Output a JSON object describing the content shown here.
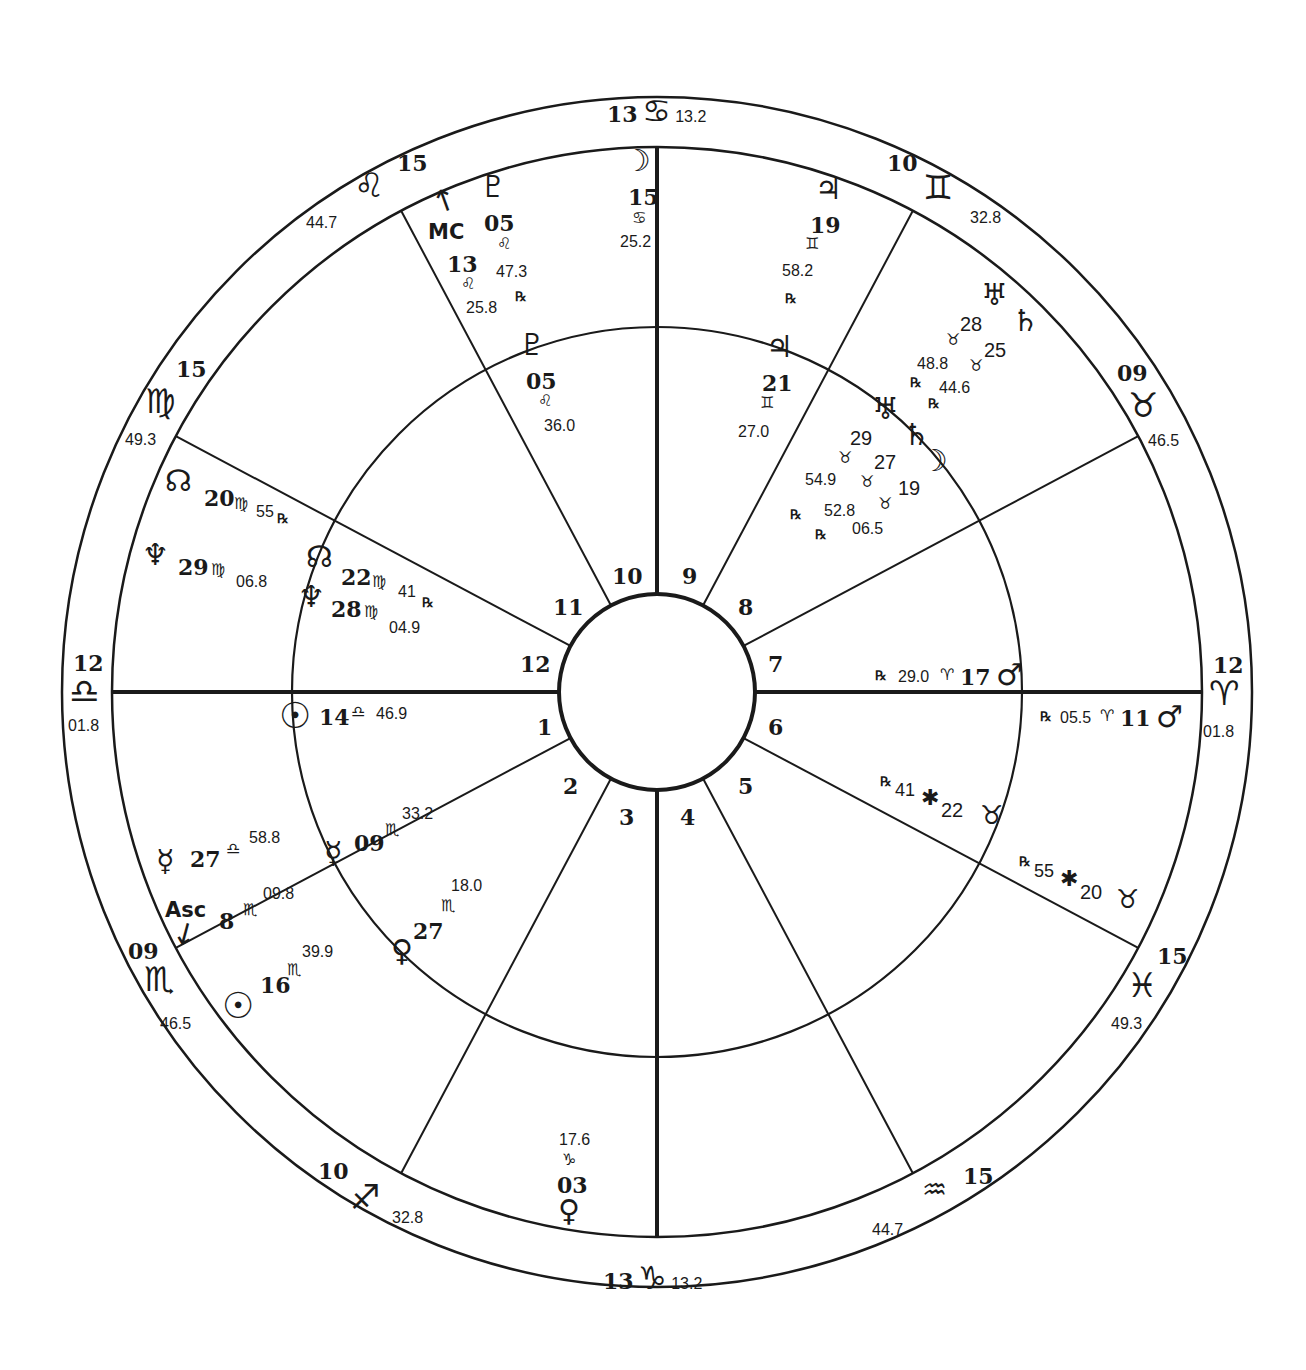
{
  "chart": {
    "center": [
      657,
      692
    ],
    "radii": {
      "outer": 595,
      "zodiac_inner": 545,
      "middle": 365,
      "hub": 98
    },
    "line_color": "#1a1a1a",
    "background": "#ffffff"
  },
  "house_cusps": [
    {
      "house": 1,
      "angle": 180
    },
    {
      "house": 2,
      "angle": 208
    },
    {
      "house": 3,
      "angle": 242
    },
    {
      "house": 4,
      "angle": 270
    },
    {
      "house": 5,
      "angle": 298
    },
    {
      "house": 6,
      "angle": 332
    },
    {
      "house": 7,
      "angle": 0
    },
    {
      "house": 8,
      "angle": 28
    },
    {
      "house": 9,
      "angle": 62
    },
    {
      "house": 10,
      "angle": 90
    },
    {
      "house": 11,
      "angle": 118
    },
    {
      "house": 12,
      "angle": 152
    }
  ],
  "house_numbers": [
    {
      "label": "1",
      "x": 537,
      "y": 716
    },
    {
      "label": "2",
      "x": 563,
      "y": 775
    },
    {
      "label": "3",
      "x": 619,
      "y": 806
    },
    {
      "label": "4",
      "x": 680,
      "y": 806
    },
    {
      "label": "5",
      "x": 738,
      "y": 775
    },
    {
      "label": "6",
      "x": 768,
      "y": 716
    },
    {
      "label": "7",
      "x": 768,
      "y": 653
    },
    {
      "label": "8",
      "x": 738,
      "y": 596
    },
    {
      "label": "9",
      "x": 682,
      "y": 565
    },
    {
      "label": "10",
      "x": 612,
      "y": 565
    },
    {
      "label": "11",
      "x": 553,
      "y": 596
    },
    {
      "label": "12",
      "x": 520,
      "y": 653
    }
  ],
  "cusp_labels": [
    {
      "id": "cusp-cancer",
      "deg": "13",
      "sign": "♋",
      "min": "13.2",
      "layout": "row",
      "x": 607,
      "y": 100
    },
    {
      "id": "cusp-gemini",
      "deg": "10",
      "sign": "♊",
      "min": "32.8",
      "layout": "gemini",
      "x": 885,
      "y": 150
    },
    {
      "id": "cusp-taurus",
      "deg": "09",
      "sign": "♉",
      "min": "46.5",
      "layout": "col",
      "x": 1117,
      "y": 360
    },
    {
      "id": "cusp-aries",
      "deg": "12",
      "sign": "♈",
      "min": "01.8",
      "layout": "col",
      "x": 1206,
      "y": 652
    },
    {
      "id": "cusp-pisces",
      "deg": "15",
      "sign": "♓",
      "min": "49.3",
      "layout": "col",
      "x": 1110,
      "y": 942
    },
    {
      "id": "cusp-aquarius",
      "deg": "15",
      "sign": "♒",
      "min": "44.7",
      "layout": "aquarius",
      "x": 895,
      "y": 1165
    },
    {
      "id": "cusp-capricorn",
      "deg": "13",
      "sign": "♑",
      "min": "13.2",
      "layout": "row",
      "x": 603,
      "y": 1262
    },
    {
      "id": "cusp-sagittarius",
      "deg": "10",
      "sign": "♐",
      "min": "32.8",
      "layout": "sag",
      "x": 318,
      "y": 1158
    },
    {
      "id": "cusp-scorpio",
      "deg": "09",
      "sign": "♏",
      "min": "46.5",
      "layout": "col",
      "x": 128,
      "y": 938
    },
    {
      "id": "cusp-libra",
      "deg": "12",
      "sign": "♎",
      "min": "01.8",
      "layout": "col",
      "x": 68,
      "y": 652
    },
    {
      "id": "cusp-virgo",
      "deg": "15",
      "sign": "♍",
      "min": "49.3",
      "layout": "virgo",
      "x": 148,
      "y": 356
    },
    {
      "id": "cusp-leo",
      "deg": "15",
      "sign": "♌",
      "min": "44.7",
      "layout": "leo",
      "x": 305,
      "y": 150
    }
  ],
  "angles": {
    "mc": {
      "label": "MC",
      "deg": "13",
      "sign": "♌",
      "min": "25.8"
    },
    "asc": {
      "label": "Asc",
      "deg": "8",
      "sign": "♏",
      "min": "09.8"
    }
  },
  "outer_planets": [
    {
      "id": "pluto-outer",
      "glyph": "♇",
      "deg": "05",
      "sign": "♌",
      "min": "47.3",
      "retro": "℞"
    },
    {
      "id": "moon-outer",
      "glyph": "☽",
      "deg": "15",
      "sign": "♋",
      "min": "25.2",
      "retro": ""
    },
    {
      "id": "jupiter-outer",
      "glyph": "♃",
      "deg": "19",
      "sign": "♊",
      "min": "58.2",
      "retro": "℞"
    },
    {
      "id": "uranus-outer",
      "glyph": "♅",
      "deg": "28",
      "sign": "♉",
      "min": "48.8",
      "retro": "℞"
    },
    {
      "id": "saturn-outer",
      "glyph": "♄",
      "deg": "25",
      "sign": "♉",
      "min": "44.6",
      "retro": "℞"
    },
    {
      "id": "node-outer",
      "glyph": "☊",
      "deg": "20",
      "sign": "♍",
      "min": "55",
      "retro": "℞"
    },
    {
      "id": "neptune-outer",
      "glyph": "♆",
      "deg": "29",
      "sign": "♍",
      "min": "06.8",
      "retro": ""
    },
    {
      "id": "mercury-outer",
      "glyph": "☿",
      "deg": "27",
      "sign": "♎",
      "min": "58.8",
      "retro": ""
    },
    {
      "id": "sun-outer",
      "glyph": "☉",
      "deg": "16",
      "sign": "♏",
      "min": "39.9",
      "retro": ""
    },
    {
      "id": "venus-outer",
      "glyph": "♀",
      "deg": "03",
      "sign": "♑",
      "min": "17.6",
      "retro": ""
    },
    {
      "id": "mars-outer",
      "glyph": "♂",
      "deg": "11",
      "sign": "♈",
      "min": "05.5",
      "retro": "℞"
    },
    {
      "id": "chiron-outer",
      "glyph": "⚷",
      "deg": "20",
      "sign": "♓",
      "min": "55",
      "retro": "℞"
    }
  ],
  "inner_planets": [
    {
      "id": "pluto-inner",
      "glyph": "♇",
      "deg": "05",
      "sign": "♌",
      "min": "36.0",
      "retro": ""
    },
    {
      "id": "jupiter-inner",
      "glyph": "♃",
      "deg": "21",
      "sign": "♊",
      "min": "27.0",
      "retro": ""
    },
    {
      "id": "uranus-inner",
      "glyph": "♅",
      "deg": "29",
      "sign": "♉",
      "min": "54.9",
      "retro": "℞"
    },
    {
      "id": "saturn-inner",
      "glyph": "♄",
      "deg": "27",
      "sign": "♉",
      "min": "52.8",
      "retro": "℞"
    },
    {
      "id": "moon-inner",
      "glyph": "☽",
      "deg": "19",
      "sign": "♉",
      "min": "06.5",
      "retro": ""
    },
    {
      "id": "node-inner",
      "glyph": "☊",
      "deg": "22",
      "sign": "♍",
      "min": "41",
      "retro": "℞"
    },
    {
      "id": "neptune-inner",
      "glyph": "♆",
      "deg": "28",
      "sign": "♍",
      "min": "04.9",
      "retro": ""
    },
    {
      "id": "sun-inner",
      "glyph": "☉",
      "deg": "14",
      "sign": "♎",
      "min": "46.9",
      "retro": ""
    },
    {
      "id": "mercury-inner",
      "glyph": "☿",
      "deg": "09",
      "sign": "♏",
      "min": "33.2",
      "retro": ""
    },
    {
      "id": "venus-inner",
      "glyph": "♀",
      "deg": "27",
      "sign": "♏",
      "min": "18.0",
      "retro": ""
    },
    {
      "id": "mars-inner",
      "glyph": "♂",
      "deg": "17",
      "sign": "♈",
      "min": "29.0",
      "retro": "℞"
    },
    {
      "id": "chiron-inner",
      "glyph": "⚷",
      "deg": "22",
      "sign": "♓",
      "min": "41",
      "retro": "℞"
    }
  ]
}
